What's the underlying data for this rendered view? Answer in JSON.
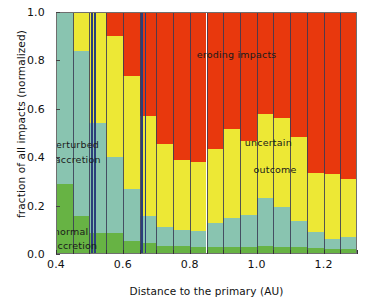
{
  "chart_data": {
    "type": "bar",
    "subtype": "stacked-bar-100pct",
    "title": "",
    "xlabel": "Distance to the primary (AU)",
    "ylabel": "fraction of all impacts (normalized)",
    "xlim": [
      0.4,
      1.3
    ],
    "ylim": [
      0.0,
      1.0
    ],
    "grid": false,
    "legend_position": "in-plot annotations",
    "xticks": [
      0.4,
      0.6,
      0.8,
      1.0,
      1.2
    ],
    "xticklabels": [
      "0.4",
      "0.6",
      "0.8",
      "1.0",
      "1.2"
    ],
    "yticks": [
      0.0,
      0.2,
      0.4,
      0.6,
      0.8,
      1.0
    ],
    "yticklabels": [
      "0.0",
      "0.2",
      "0.4",
      "0.6",
      "0.8",
      "1.0"
    ],
    "bin_width": 0.05,
    "bin_left_edges": [
      0.4,
      0.45,
      0.5,
      0.55,
      0.6,
      0.65,
      0.7,
      0.75,
      0.8,
      0.85,
      0.9,
      0.95,
      1.0,
      1.05,
      1.1,
      1.15,
      1.2,
      1.25
    ],
    "bin_centers": [
      0.425,
      0.475,
      0.525,
      0.575,
      0.625,
      0.675,
      0.725,
      0.775,
      0.825,
      0.875,
      0.925,
      0.975,
      1.025,
      1.075,
      1.125,
      1.175,
      1.225,
      1.275
    ],
    "series": [
      {
        "name": "normal accretion",
        "color": "#67b344",
        "values": [
          0.29,
          0.155,
          0.085,
          0.085,
          0.055,
          0.045,
          0.035,
          0.035,
          0.03,
          0.03,
          0.03,
          0.03,
          0.035,
          0.03,
          0.03,
          0.025,
          0.02,
          0.02
        ]
      },
      {
        "name": "perturbed accretion",
        "color": "#89c4b0",
        "values": [
          0.71,
          0.685,
          0.455,
          0.315,
          0.215,
          0.11,
          0.075,
          0.065,
          0.065,
          0.1,
          0.12,
          0.13,
          0.195,
          0.165,
          0.105,
          0.065,
          0.04,
          0.05
        ]
      },
      {
        "name": "uncertain outcome",
        "color": "#ede835",
        "values": [
          0.0,
          0.16,
          0.46,
          0.5,
          0.465,
          0.415,
          0.345,
          0.29,
          0.285,
          0.305,
          0.365,
          0.305,
          0.35,
          0.365,
          0.35,
          0.245,
          0.27,
          0.24
        ]
      },
      {
        "name": "eroding impacts",
        "color": "#e8380d",
        "values": [
          0.0,
          0.0,
          0.0,
          0.1,
          0.265,
          0.43,
          0.545,
          0.61,
          0.62,
          0.565,
          0.485,
          0.535,
          0.42,
          0.44,
          0.515,
          0.665,
          0.67,
          0.69
        ]
      }
    ],
    "vertical_markers": [
      0.505,
      0.515,
      0.655,
      0.665
    ],
    "annotations": [
      {
        "text": "eroding impacts",
        "x": 0.94,
        "y": 0.82
      },
      {
        "text": "perturbed",
        "x": 0.455,
        "y": 0.445
      },
      {
        "text": "accretion",
        "x": 0.465,
        "y": 0.385
      },
      {
        "text": "uncertain",
        "x": 1.035,
        "y": 0.455
      },
      {
        "text": "outcome",
        "x": 1.055,
        "y": 0.345
      },
      {
        "text": "normal",
        "x": 0.445,
        "y": 0.085
      },
      {
        "text": "accretion",
        "x": 0.455,
        "y": 0.03
      }
    ]
  },
  "colors": {
    "normal_accretion": "#67b344",
    "perturbed_accretion": "#89c4b0",
    "uncertain_outcome": "#ede835",
    "eroding_impacts": "#e8380d",
    "separator": "#3a3a55",
    "marker_line": "#2b3f7a",
    "axis": "#6f6f6f",
    "text": "#111111",
    "background": "#ffffff"
  }
}
